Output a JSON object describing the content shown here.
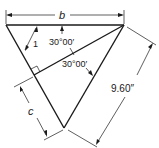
{
  "figure": {
    "type": "geometry-diagram",
    "labels": {
      "top_dimension": "b",
      "lower_left_dimension": "c",
      "right_dimension": "9.60″",
      "angle_top": "30°00′",
      "angle_middle": "30°00′",
      "side_marker": "1"
    },
    "colors": {
      "stroke": "#1a1a1a",
      "background": "#ffffff"
    }
  }
}
